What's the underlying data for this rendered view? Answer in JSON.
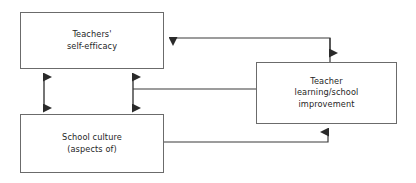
{
  "diagram": {
    "type": "flow-diagram",
    "background_color": "#ffffff",
    "box_border_color": "#6b6b6b",
    "connector_color": "#4a4a4a",
    "text_color": "#262626",
    "nodes": [
      {
        "id": "self_efficacy",
        "label": "Teachers'\nself-efficacy",
        "x": 20,
        "y": 12,
        "width": 144,
        "height": 57
      },
      {
        "id": "school_culture",
        "label": "School culture\n(aspects of)",
        "x": 20,
        "y": 114,
        "width": 144,
        "height": 59
      },
      {
        "id": "teacher_learning",
        "label": "Teacher\nlearning/school\nimprovement",
        "x": 256,
        "y": 62,
        "width": 141,
        "height": 62
      }
    ],
    "connectors": [
      {
        "id": "self-efficacy-to-school-culture-left",
        "from": "self_efficacy",
        "to": "school_culture",
        "direction": "bidirectional",
        "style": "double-headed-vertical"
      },
      {
        "id": "self-efficacy-to-school-culture-right",
        "from": "self_efficacy",
        "to": "school_culture",
        "direction": "bidirectional",
        "style": "double-headed-vertical"
      },
      {
        "id": "teacher-learning-to-self-efficacy",
        "from": "teacher_learning",
        "to": "self_efficacy",
        "direction": "single",
        "style": "elbow-left"
      },
      {
        "id": "self-efficacy-school-culture-to-teacher-learning",
        "from": "self_efficacy_school_culture_link",
        "to": "teacher_learning",
        "direction": "single",
        "style": "elbow-right-down"
      },
      {
        "id": "school-culture-to-teacher-learning",
        "from": "school_culture",
        "to": "teacher_learning",
        "direction": "single",
        "style": "elbow-right-up"
      }
    ]
  }
}
